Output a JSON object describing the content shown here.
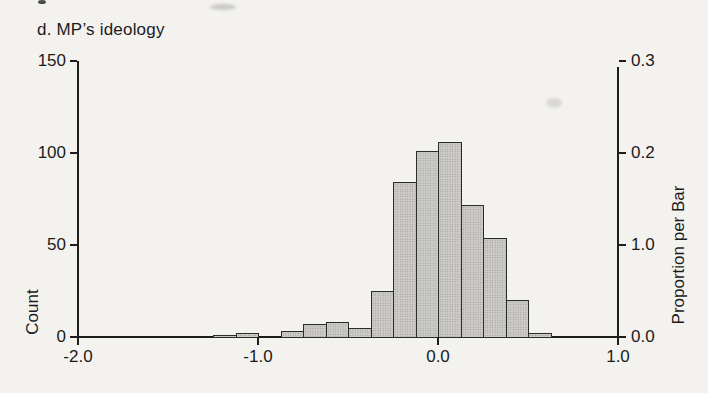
{
  "figure": {
    "title": "d. MP’s ideology",
    "background_color": "#f3f2ef",
    "text_color": "#1b1b1b"
  },
  "chart_data": {
    "type": "bar",
    "subtype": "histogram",
    "title": "d. MP’s ideology",
    "xlabel": "",
    "ylabel_left": "Count",
    "ylabel_right": "Proportion per Bar",
    "xlim": [
      -2.0,
      1.0
    ],
    "ylim_left": [
      0,
      150
    ],
    "ylim_right": [
      0.0,
      0.3
    ],
    "grid": "off",
    "legend": "none",
    "bin_width": 0.125,
    "x_ticks": [
      {
        "value": -2.0,
        "label": "-2.0"
      },
      {
        "value": -1.0,
        "label": "-1.0"
      },
      {
        "value": 0.0,
        "label": "0.0"
      },
      {
        "value": 1.0,
        "label": "1.0"
      }
    ],
    "y_ticks_left": [
      {
        "count": 0,
        "label": "0"
      },
      {
        "count": 50,
        "label": "50"
      },
      {
        "count": 100,
        "label": "100"
      },
      {
        "count": 150,
        "label": "150"
      }
    ],
    "y_ticks_right": [
      {
        "count": 0,
        "label": "0.0"
      },
      {
        "count": 50,
        "label": "1.0"
      },
      {
        "count": 100,
        "label": "0.2"
      },
      {
        "count": 150,
        "label": "0.3"
      }
    ],
    "bins": [
      {
        "x0": -1.25,
        "x1": -1.125,
        "count": 1
      },
      {
        "x0": -1.125,
        "x1": -1.0,
        "count": 2
      },
      {
        "x0": -1.0,
        "x1": -0.875,
        "count": 0
      },
      {
        "x0": -0.875,
        "x1": -0.75,
        "count": 3
      },
      {
        "x0": -0.75,
        "x1": -0.625,
        "count": 7
      },
      {
        "x0": -0.625,
        "x1": -0.5,
        "count": 8
      },
      {
        "x0": -0.5,
        "x1": -0.375,
        "count": 5
      },
      {
        "x0": -0.375,
        "x1": -0.25,
        "count": 25
      },
      {
        "x0": -0.25,
        "x1": -0.125,
        "count": 84
      },
      {
        "x0": -0.125,
        "x1": 0.0,
        "count": 101
      },
      {
        "x0": 0.0,
        "x1": 0.125,
        "count": 106
      },
      {
        "x0": 0.125,
        "x1": 0.25,
        "count": 72
      },
      {
        "x0": 0.25,
        "x1": 0.375,
        "count": 54
      },
      {
        "x0": 0.375,
        "x1": 0.5,
        "count": 20
      },
      {
        "x0": 0.5,
        "x1": 0.625,
        "count": 2
      }
    ],
    "bar_fill_color": "#cbcac6",
    "bar_stipple_color": "#8e8d89",
    "bar_border_color": "#2b2b2b",
    "axis_color": "#1d1d1d"
  }
}
